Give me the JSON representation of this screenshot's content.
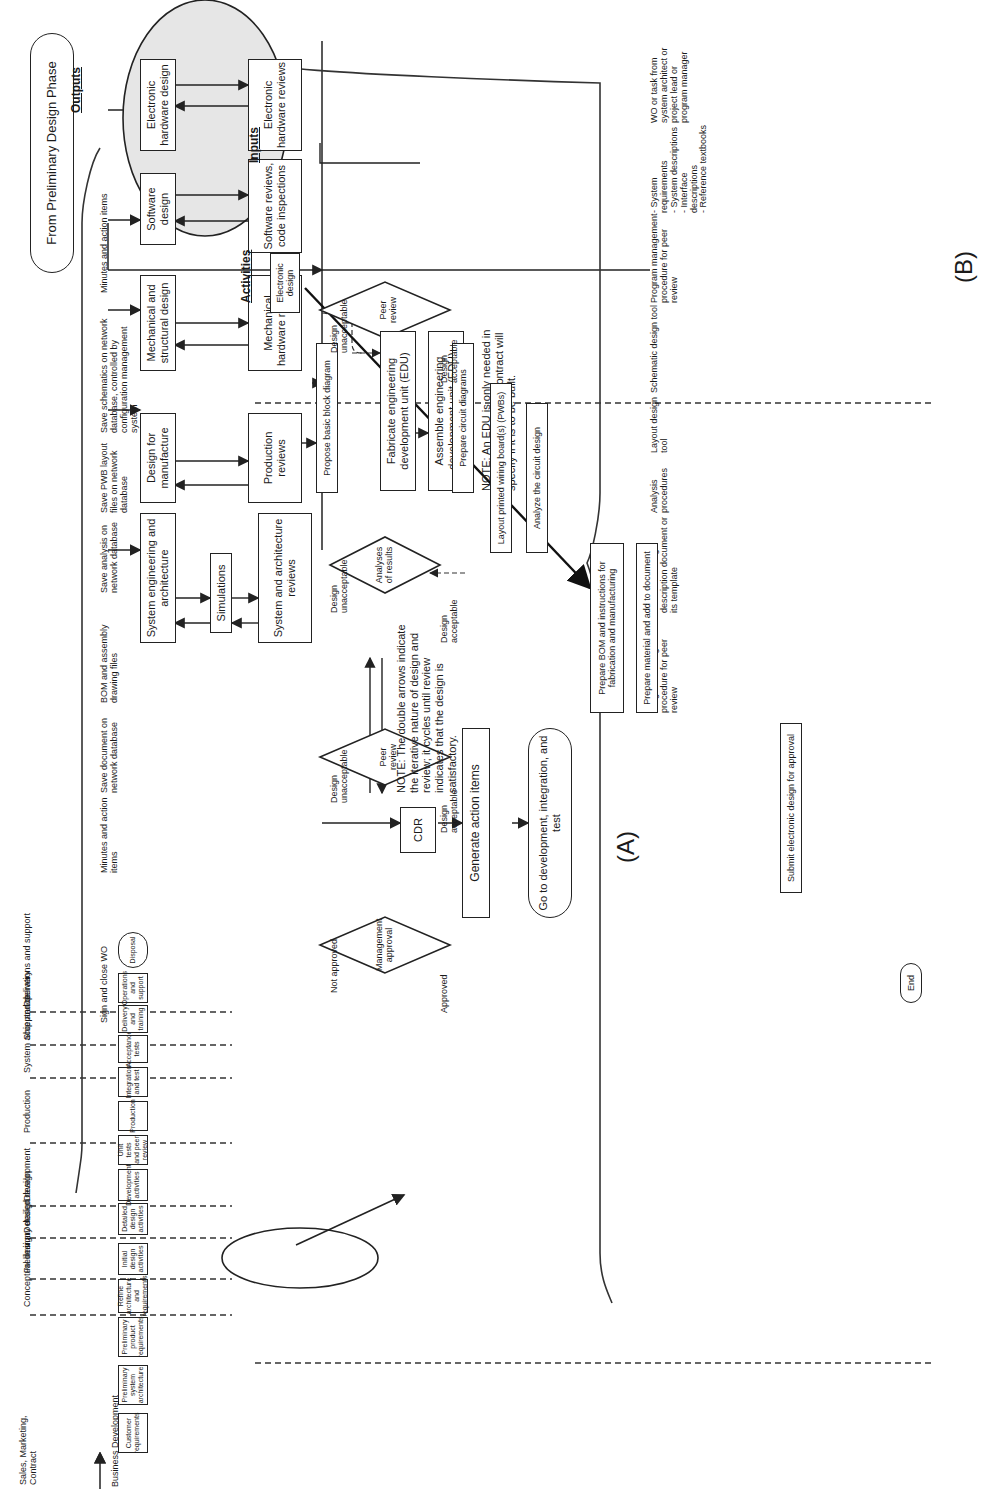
{
  "diagram_a": {
    "label": "(A)",
    "lifecycle": {
      "phase_labels": [
        "Sales, Marketing, Contract",
        "Conceptual design",
        "Preliminary design",
        "Detailed design",
        "Development",
        "Production",
        "System acceptance",
        "Ship and delivery",
        "Operations and support"
      ],
      "start": "Business Development",
      "steps": [
        "Customer requirements",
        "Preliminary system architecture",
        "Preliminary product requirements",
        "Refine architecture and requirements",
        "Initial design activities",
        "Detailed design activities",
        "Development activities",
        "Unit tests and peer review",
        "Production",
        "Integration and test",
        "Acceptance tests",
        "Delivery and training",
        "Operations and support"
      ],
      "end": "Disposal",
      "highlighted_step": "Detailed design activities"
    },
    "detailed_design": {
      "start": "From Preliminary Design Phase",
      "design_boxes": [
        "Electronic hardware design",
        "Software design",
        "Mechanical and structural design",
        "Design for manufacture",
        "System engineering and architecture"
      ],
      "simulations": "Simulations",
      "review_boxes": [
        "Electronic hardware reviews",
        "Software reviews, code inspections",
        "Mechanical hardware reviews",
        "Production reviews",
        "System and architecture reviews"
      ],
      "edu_steps": [
        "Fabricate engineering development unit (EDU)",
        "Assemble engineering development unit (EDU)"
      ],
      "cdr": "CDR",
      "action_items": "Generate action items",
      "end": "Go to development, integration, and test",
      "note_arrows": "NOTE: The double arrows indicate the iterative nature of design and review; it cycles until review indicates that the design is satisfactory.",
      "note_edu": "NOTE: An EDU is only needed in some situations; the contract will specify if it is to be built."
    }
  },
  "diagram_b": {
    "label": "(B)",
    "columns": {
      "inputs": "Inputs",
      "activities": "Activities",
      "outputs": "Outputs"
    },
    "inputs": [
      "WO or task from system architect or project lead or program manager",
      "- System requirements\n- System descriptions\n- Interface descriptions\n- Reference textbooks",
      "Program management procedure for peer review",
      "Schematic design tool",
      "Layout design tool",
      "Analysis procedures",
      "Electronic design description document or its template",
      "Program management procedure for peer review"
    ],
    "activities": {
      "start": "Electronic design",
      "propose": "Propose basic block diagram",
      "peer_review_1": "Peer review",
      "circuit": "Prepare circuit diagrams",
      "layout": "Layout printed wiring board(s) (PWBs)",
      "analyze": "Analyze the circuit design",
      "analyses": "Analyses of results",
      "bom": "Prepare BOM and instructions for fabrication and manufacturing",
      "material": "Prepare material and add to document",
      "peer_review_2": "Peer review",
      "submit": "Submit electronic design for approval",
      "mgmt": "Management approval",
      "end": "End"
    },
    "branch_labels": {
      "unacceptable": "Design unacceptable",
      "acceptable": "Design acceptable",
      "not_approved": "Not approved",
      "approved": "Approved"
    },
    "outputs": [
      "Minutes and action items",
      "Save schematics on network database, controlled by configuration management system",
      "Save PWB layout files on network database",
      "Save analysis on network database",
      "BOM and assembly drawing files",
      "Save document on network database",
      "Minutes and action items",
      "Sign and close WO"
    ]
  }
}
